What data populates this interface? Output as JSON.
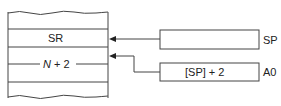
{
  "memory": {
    "cells": [
      {
        "label": "SR"
      },
      {
        "label": "N + 2",
        "italic_part": "N",
        "rest": " + 2"
      }
    ]
  },
  "registers": [
    {
      "name": "SP",
      "contents": ""
    },
    {
      "name": "A0",
      "contents": "[SP] + 2"
    }
  ]
}
